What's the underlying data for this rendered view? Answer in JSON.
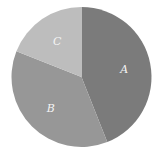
{
  "chart_data": {
    "type": "pie",
    "title": "",
    "categories": [
      "A",
      "B",
      "C"
    ],
    "values": [
      44,
      37,
      19
    ],
    "colors": [
      "#7b7b7b",
      "#979797",
      "#bdbdbd"
    ],
    "start_angle_deg": 0,
    "direction": "clockwise",
    "legend": "none",
    "labels_inside": true
  }
}
